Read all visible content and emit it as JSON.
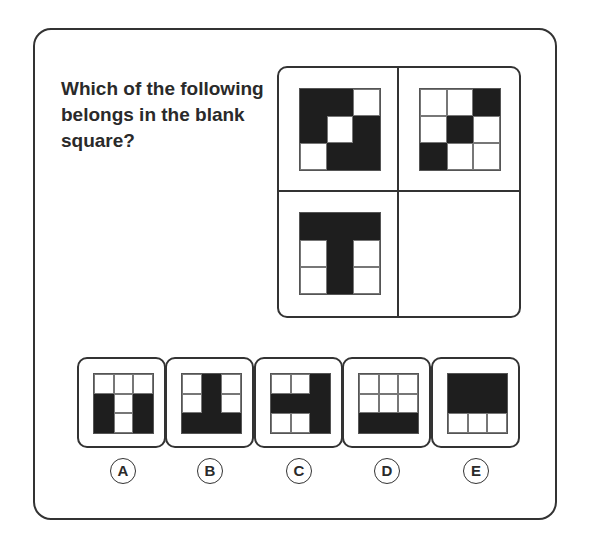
{
  "question": {
    "line1": "Which of the following",
    "line2": "belongs in the blank",
    "line3": "square?"
  },
  "matrix": {
    "cells": [
      {
        "pattern": [
          [
            1,
            1,
            0
          ],
          [
            1,
            0,
            1
          ],
          [
            0,
            1,
            1
          ]
        ]
      },
      {
        "pattern": [
          [
            0,
            0,
            1
          ],
          [
            0,
            1,
            0
          ],
          [
            1,
            0,
            0
          ]
        ]
      },
      {
        "pattern": [
          [
            1,
            1,
            1
          ],
          [
            0,
            1,
            0
          ],
          [
            0,
            1,
            0
          ]
        ]
      },
      {
        "pattern": null,
        "blank": true
      }
    ]
  },
  "options": [
    {
      "label": "A",
      "pattern": [
        [
          0,
          0,
          0
        ],
        [
          1,
          0,
          1
        ],
        [
          1,
          0,
          1
        ]
      ]
    },
    {
      "label": "B",
      "pattern": [
        [
          0,
          1,
          0
        ],
        [
          0,
          1,
          0
        ],
        [
          1,
          1,
          1
        ]
      ]
    },
    {
      "label": "C",
      "pattern": [
        [
          0,
          0,
          1
        ],
        [
          1,
          1,
          1
        ],
        [
          0,
          0,
          1
        ]
      ]
    },
    {
      "label": "D",
      "pattern": [
        [
          0,
          0,
          0
        ],
        [
          0,
          0,
          0
        ],
        [
          1,
          1,
          1
        ]
      ]
    },
    {
      "label": "E",
      "pattern": [
        [
          1,
          1,
          1
        ],
        [
          1,
          1,
          1
        ],
        [
          0,
          0,
          0
        ]
      ]
    }
  ],
  "colors": {
    "filled": "#1e1e1e",
    "empty": "#ffffff",
    "border": "#333333"
  }
}
